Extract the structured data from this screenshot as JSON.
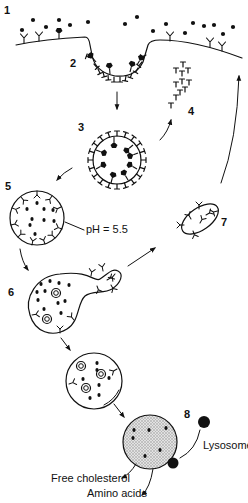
{
  "diagram": {
    "step_labels": [
      {
        "id": "1",
        "text": "1",
        "x": 4,
        "y": 14
      },
      {
        "id": "2",
        "text": "2",
        "x": 70,
        "y": 67
      },
      {
        "id": "3",
        "text": "3",
        "x": 78,
        "y": 131
      },
      {
        "id": "4",
        "text": "4",
        "x": 188,
        "y": 115
      },
      {
        "id": "5",
        "text": "5",
        "x": 5,
        "y": 190
      },
      {
        "id": "6",
        "text": "6",
        "x": 8,
        "y": 296
      },
      {
        "id": "7",
        "text": "7",
        "x": 221,
        "y": 226
      },
      {
        "id": "8",
        "text": "8",
        "x": 184,
        "y": 418
      }
    ],
    "annotations": {
      "ph": "pH = 5.5",
      "lysosome": "Lysosome",
      "free_cholesterol": "Free cholesterol",
      "amino_acids": "Amino acids"
    },
    "colors": {
      "ink": "#111111",
      "lysosome_fill": "#cfcfcf",
      "background": "#ffffff"
    },
    "stages": [
      {
        "id": "1",
        "name": "LDL particles bind surface receptors"
      },
      {
        "id": "2",
        "name": "Coated pit"
      },
      {
        "id": "3",
        "name": "Coated vesicle"
      },
      {
        "id": "4",
        "name": "Clathrin coat recycled"
      },
      {
        "id": "5",
        "name": "Endosome (acidified)"
      },
      {
        "id": "6",
        "name": "Receptor sorting (CURL)"
      },
      {
        "id": "7",
        "name": "Receptor recycling vesicle"
      },
      {
        "id": "8",
        "name": "Fusion with lysosome"
      }
    ]
  }
}
